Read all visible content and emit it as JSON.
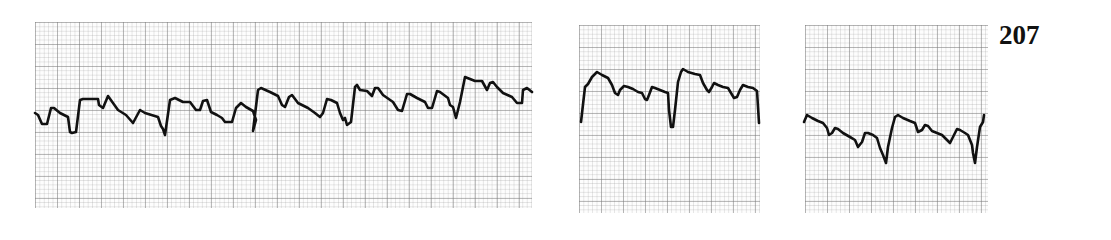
{
  "figure": {
    "number": "207"
  },
  "colors": {
    "background": "#ffffff",
    "paper": "#fdfdfd",
    "grid_major": "#8c8c8c",
    "grid_minor": "#b4b4b4",
    "trace": "#111111"
  },
  "strips": [
    {
      "id": "strip-1",
      "bounds": {
        "x": 35,
        "y": 22,
        "width": 497,
        "height": 186
      },
      "trace_points": "35,113 38,115 42,124 47,124 51,108 54,108 60,113 68,117 70,132 72,133 76,132 80,100 83,99 98,99 99,105 103,108 108,96 118,110 126,115 133,123 140,110 145,113 158,117 161,126 163,129 165,135 170,100 175,98 183,102 190,102 196,110 200,110 203,101 207,100 211,112 217,115 222,118 225,122 232,122 236,108 241,103 246,107 253,111 256,120 253,131 258,90 261,88 270,92 278,96 282,105 285,107 289,97 292,95 298,103 308,108 315,113 320,117 323,113 327,99 331,100 337,103 340,113 343,120 345,118 347,125 351,122 355,87 357,85 360,90 367,91 372,96 375,88 378,88 383,95 393,102 398,110 402,111 407,94 410,94 417,98 425,102 428,108 432,108 437,91 440,92 448,98 450,105 453,107 456,118 460,102 465,77 470,79 475,81 482,81 487,90 490,83 493,82 497,87 503,93 512,97 517,103 522,103 523,90 527,88 532,92"
    },
    {
      "id": "strip-2",
      "bounds": {
        "x": 579,
        "y": 25,
        "width": 181,
        "height": 188
      },
      "trace_points": "581,122 585,87 588,84 592,77 597,72 602,75 608,78 612,85 615,93 618,95 620,90 624,86 628,87 633,89 638,92 642,93 645,99 647,100 649,95 652,87 655,88 660,90 665,92 668,93 669,110 671,127 673,127 675,110 678,82 681,72 683,69 688,72 695,74 700,75 703,83 707,90 709,92 712,87 714,83 718,85 723,87 728,88 731,93 734,98 737,97 740,90 743,85 748,87 753,88 757,91 758,107 759,123"
    },
    {
      "id": "strip-3",
      "bounds": {
        "x": 805,
        "y": 25,
        "width": 183,
        "height": 188
      },
      "trace_points": "804,122 807,115 812,118 818,121 823,123 827,128 829,135 832,133 835,128 838,129 843,133 850,137 855,140 858,147 862,142 865,133 868,133 873,135 877,138 880,148 883,155 886,163 888,147 892,128 895,117 898,115 903,118 910,121 915,123 918,132 922,130 925,125 928,126 932,131 937,133 942,135 947,140 950,143 953,137 957,129 960,130 965,133 968,135 972,145 973,153 975,163 977,147 980,127 983,122 984,115"
    }
  ]
}
